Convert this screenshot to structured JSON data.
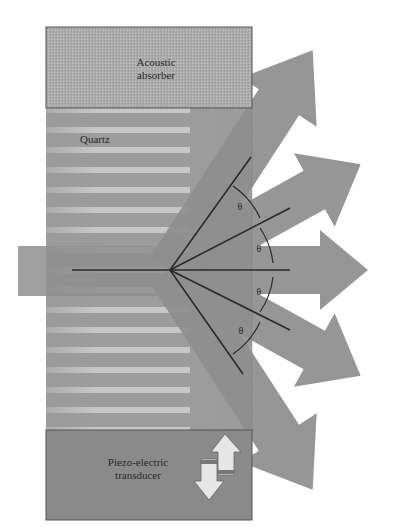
{
  "diagram": {
    "labels": {
      "absorber_line1": "Acoustic",
      "absorber_line2": "absorber",
      "quartz": "Quartz",
      "transducer_line1": "Piezo-electric",
      "transducer_line2": "transducer",
      "theta_1": "θ",
      "theta_2": "θ",
      "theta_3": "θ",
      "theta_4": "θ"
    },
    "components": [
      "acoustic-absorber",
      "quartz-crystal",
      "piezo-electric-transducer",
      "input-beam",
      "diffracted-beams"
    ],
    "beams": {
      "input": "horizontal from left",
      "outputs": [
        {
          "order": "+2",
          "angle": "2θ upward"
        },
        {
          "order": "+1",
          "angle": "θ upward"
        },
        {
          "order": "0",
          "angle": "0"
        },
        {
          "order": "-1",
          "angle": "θ downward"
        },
        {
          "order": "-2",
          "angle": "2θ downward"
        }
      ]
    },
    "colors": {
      "block": "#9a9a9a",
      "absorber": "#a8a8a8",
      "beam": "#8e8e8e",
      "stripes": "#c8c8c8",
      "lines": "#2a2a2a"
    }
  }
}
